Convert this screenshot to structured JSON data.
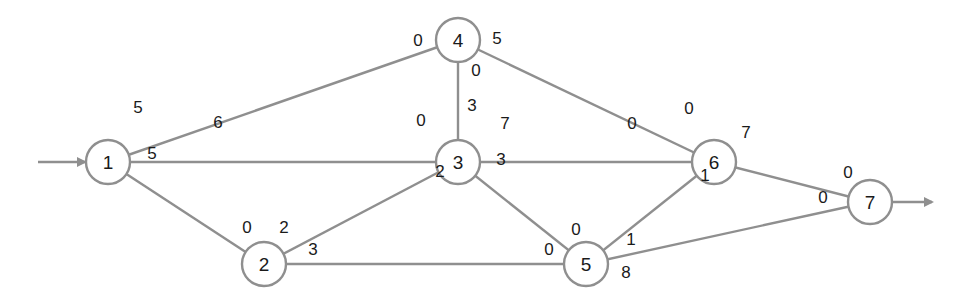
{
  "diagram": {
    "type": "network-flow-graph",
    "colors": {
      "edge": "#8f8f8f",
      "node_stroke": "#8f8f8f",
      "text": "#1a1a1a"
    },
    "nodes": [
      {
        "id": "1",
        "label": "1",
        "x": 108,
        "y": 162
      },
      {
        "id": "2",
        "label": "2",
        "x": 264,
        "y": 264
      },
      {
        "id": "3",
        "label": "3",
        "x": 458,
        "y": 162
      },
      {
        "id": "4",
        "label": "4",
        "x": 458,
        "y": 40
      },
      {
        "id": "5",
        "label": "5",
        "x": 586,
        "y": 264
      },
      {
        "id": "6",
        "label": "6",
        "x": 714,
        "y": 162
      },
      {
        "id": "7",
        "label": "7",
        "x": 870,
        "y": 202
      }
    ],
    "edges": [
      {
        "from": "1",
        "to": "4",
        "start_label": "5",
        "end_label": "0"
      },
      {
        "from": "1",
        "to": "3",
        "start_label": "6",
        "end_label": "0"
      },
      {
        "from": "1",
        "to": "2",
        "start_label": "5",
        "end_label": "0"
      },
      {
        "from": "2",
        "to": "3",
        "start_label": "2",
        "end_label": "2"
      },
      {
        "from": "2",
        "to": "5",
        "start_label": "3",
        "end_label": "0"
      },
      {
        "from": "4",
        "to": "3",
        "start_label": "0",
        "end_label": "3"
      },
      {
        "from": "4",
        "to": "6",
        "start_label": "5",
        "end_label": "0"
      },
      {
        "from": "3",
        "to": "6",
        "start_label": "7",
        "end_label": "0"
      },
      {
        "from": "3",
        "to": "5",
        "start_label": "3",
        "end_label": "0"
      },
      {
        "from": "5",
        "to": "6",
        "start_label": "1",
        "end_label": "1"
      },
      {
        "from": "5",
        "to": "7",
        "start_label": "8",
        "end_label": "0"
      },
      {
        "from": "6",
        "to": "7",
        "start_label": "7",
        "end_label": "0"
      }
    ],
    "labels": [
      {
        "text": "5",
        "x": 138,
        "y": 107
      },
      {
        "text": "6",
        "x": 218,
        "y": 122
      },
      {
        "text": "5",
        "x": 152,
        "y": 153
      },
      {
        "text": "0",
        "x": 418,
        "y": 40
      },
      {
        "text": "5",
        "x": 497,
        "y": 38
      },
      {
        "text": "0",
        "x": 476,
        "y": 70
      },
      {
        "text": "3",
        "x": 472,
        "y": 105
      },
      {
        "text": "0",
        "x": 421,
        "y": 120
      },
      {
        "text": "7",
        "x": 505,
        "y": 123
      },
      {
        "text": "3",
        "x": 501,
        "y": 159
      },
      {
        "text": "2",
        "x": 440,
        "y": 171
      },
      {
        "text": "0",
        "x": 247,
        "y": 227
      },
      {
        "text": "2",
        "x": 284,
        "y": 227
      },
      {
        "text": "3",
        "x": 313,
        "y": 249
      },
      {
        "text": "0",
        "x": 576,
        "y": 229
      },
      {
        "text": "0",
        "x": 549,
        "y": 249
      },
      {
        "text": "1",
        "x": 631,
        "y": 239
      },
      {
        "text": "8",
        "x": 626,
        "y": 272
      },
      {
        "text": "0",
        "x": 689,
        "y": 108
      },
      {
        "text": "0",
        "x": 632,
        "y": 123
      },
      {
        "text": "7",
        "x": 746,
        "y": 132
      },
      {
        "text": "1",
        "x": 705,
        "y": 175
      },
      {
        "text": "0",
        "x": 848,
        "y": 172
      },
      {
        "text": "0",
        "x": 823,
        "y": 197
      }
    ],
    "source_arrow": {
      "x1": 38,
      "y1": 162,
      "x2": 85,
      "y2": 162
    },
    "sink_arrow": {
      "x1": 892,
      "y1": 202,
      "x2": 932,
      "y2": 202
    }
  }
}
